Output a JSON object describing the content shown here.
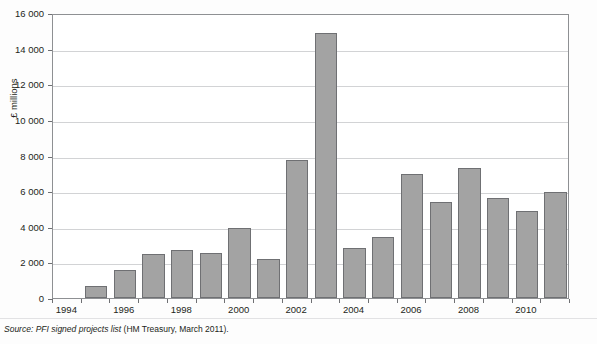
{
  "figure": {
    "title_faint": "",
    "source_prefix": "Source:",
    "source_italic": "PFI signed projects list",
    "source_rest": "(HM Treasury, March 2011)."
  },
  "axes": {
    "ylabel": "£ millions",
    "ytick_labels": [
      "16 000",
      "14 000",
      "12 000",
      "10 000",
      "8 000",
      "6 000",
      "4 000",
      "2 000",
      "0"
    ],
    "xtick_labels": [
      "1994",
      "1996",
      "1998",
      "2000",
      "2002",
      "2004",
      "2006",
      "2008",
      "2010"
    ]
  },
  "colors": {
    "bar_fill": "#a3a3a3",
    "bar_stroke": "#6f7073",
    "gridline": "#d2d3d5",
    "axis": "#8e9093",
    "text": "#231f20",
    "page_bg": "#fdfdfd"
  },
  "chart_data": {
    "type": "bar",
    "title": "",
    "xlabel": "",
    "ylabel": "£ millions",
    "ylim": [
      0,
      16000
    ],
    "ytick_step": 2000,
    "grid": true,
    "legend": "none",
    "categories": [
      1994,
      1995,
      1996,
      1997,
      1998,
      1999,
      2000,
      2001,
      2002,
      2003,
      2004,
      2005,
      2006,
      2007,
      2008,
      2009,
      2010,
      2011
    ],
    "values": [
      0,
      700,
      1600,
      2450,
      2700,
      2550,
      3950,
      2200,
      7750,
      14900,
      2800,
      3450,
      6950,
      5400,
      7300,
      5600,
      4900,
      5950
    ],
    "series": [
      {
        "name": "PFI signed projects capital value",
        "values": [
          0,
          700,
          1600,
          2450,
          2700,
          2550,
          3950,
          2200,
          7750,
          14900,
          2800,
          3450,
          6950,
          5400,
          7300,
          5600,
          4900,
          5950
        ]
      }
    ]
  }
}
